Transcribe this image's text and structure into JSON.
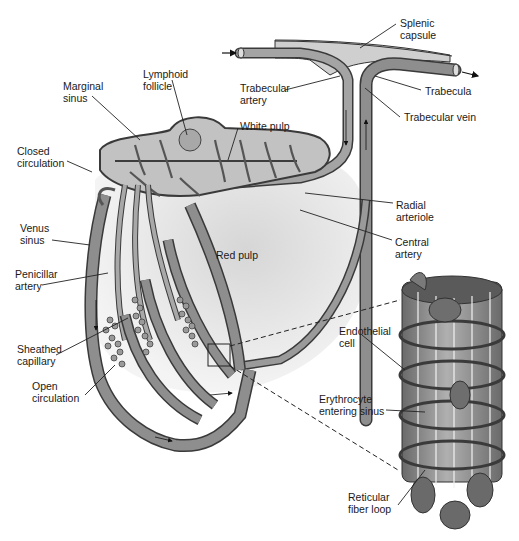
{
  "figure": {
    "type": "anatomical-diagram",
    "style": "grayscale illustration",
    "colors": {
      "background": "#ffffff",
      "red_pulp_fill": "#e2e2e2",
      "vessel_fill": "#8c8c8c",
      "vessel_stroke": "#3a3a3a",
      "white_pulp_fill": "#c4c4c4",
      "label_text": "#1a1a1a",
      "leader_line": "#222222"
    }
  },
  "labels": {
    "splenic_capsule": "Splenic\ncapsule",
    "lymphoid_follicle": "Lymphoid\nfollicle",
    "marginal_sinus": "Marginal\nsinus",
    "trabecular_artery": "Trabecular\nartery",
    "trabecula": "Trabecula",
    "trabecular_vein": "Trabecular vein",
    "white_pulp": "White pulp",
    "closed_circulation": "Closed\ncirculation",
    "radial_arteriole": "Radial\narteriole",
    "central_artery": "Central\nartery",
    "venus_sinus": "Venus\nsinus",
    "red_pulp": "Red pulp",
    "penicillar_artery": "Penicillar\nartery",
    "endothelial_cell": "Endothelial\ncell",
    "sheathed_capillary": "Sheathed\ncapillary",
    "erythrocyte_entering_sinus": "Erythrocyte\nentering sinus",
    "open_circulation": "Open\ncirculation",
    "reticular_fiber_loop": "Reticular\nfiber loop"
  }
}
